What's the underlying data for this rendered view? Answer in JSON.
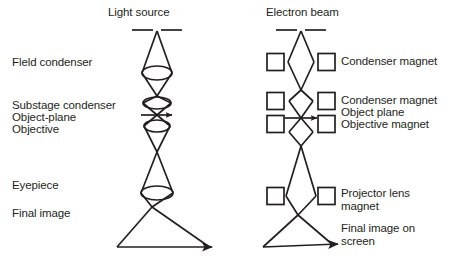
{
  "figure": {
    "type": "diagram",
    "kind": "ray-path-comparison",
    "background_color": "#ffffff",
    "ink_color": "#231f20",
    "panels": [
      {
        "id": "optical-microscope",
        "side": "left",
        "axis_x": 157,
        "source": {
          "name": "light-source",
          "label": "Light source",
          "label_x": 108,
          "label_y": 8,
          "aperture_y": 30,
          "aperture_gap_px": 8,
          "aperture_half_width": 25
        },
        "lens_style": "biconvex-ellipse",
        "elements": [
          {
            "name": "field-condenser",
            "label": "Field condenser",
            "label_x": 12,
            "label_y": 57,
            "lens_y": 73,
            "lens_rx": 15,
            "lens_ry": 7
          },
          {
            "name": "substage-condenser",
            "label": "Substage condenser",
            "label_x": 12,
            "label_y": 100,
            "lens_y": 103,
            "lens_rx": 14,
            "lens_ry": 6
          },
          {
            "name": "object-plane",
            "label": "Object-plane",
            "label_x": 12,
            "label_y": 112,
            "plane_y": 115,
            "arrow": "right"
          },
          {
            "name": "objective",
            "label": "Objective",
            "label_x": 12,
            "label_y": 124,
            "lens_y": 126,
            "lens_rx": 13,
            "lens_ry": 6
          },
          {
            "name": "eyepiece",
            "label": "Eyepiece",
            "label_x": 12,
            "label_y": 180,
            "lens_y": 193,
            "lens_rx": 16,
            "lens_ry": 7
          },
          {
            "name": "final-image",
            "label": "Final image",
            "label_x": 12,
            "label_y": 208,
            "image_y": 247,
            "arrow": "right"
          }
        ],
        "crossovers_y": [
          96,
          152,
          207
        ]
      },
      {
        "id": "electron-microscope",
        "side": "right",
        "axis_x": 301,
        "source": {
          "name": "electron-beam",
          "label": "Electron beam",
          "label_x": 266,
          "label_y": 8,
          "aperture_y": 30,
          "aperture_gap_px": 8,
          "aperture_half_width": 25
        },
        "lens_style": "square-magnet-pair",
        "magnet_box_size": 17,
        "magnet_box_offset_x": 34,
        "elements": [
          {
            "name": "condenser-magnet-1",
            "label": "Condenser magnet",
            "label_x": 340,
            "label_y": 62,
            "box_y": 62
          },
          {
            "name": "condenser-magnet-2",
            "label": "Condenser magnet",
            "label_x": 340,
            "label_y": 101,
            "box_y": 101
          },
          {
            "name": "object-plane",
            "label": "Object plane",
            "label_x": 340,
            "label_y": 113,
            "plane_y": 118,
            "arrow": "right"
          },
          {
            "name": "objective-magnet",
            "label": "Objective magnet",
            "label_x": 340,
            "label_y": 125,
            "box_y": 124
          },
          {
            "name": "projector-lens-magnet",
            "label": "Projector lens\nmagnet",
            "label_x": 340,
            "label_y": 192,
            "box_y": 196
          },
          {
            "name": "final-image-on-screen",
            "label": "Final image on\nscreen",
            "label_x": 340,
            "label_y": 224,
            "image_y": 247,
            "arrow": "right"
          }
        ],
        "crossovers_y": [
          90,
          146,
          215
        ]
      }
    ]
  },
  "labels": {
    "left": {
      "light_source": "Light source",
      "field_condenser": "Fleld condenser",
      "substage_condenser": "Substage condenser",
      "object_plane": "Object-plane",
      "objective": "Objective",
      "eyepiece": "Eyepiece",
      "final_image": "Final image"
    },
    "right": {
      "electron_beam": "Electron beam",
      "condenser_magnet_1": "Condenser magnet",
      "condenser_magnet_2": "Condenser magnet",
      "object_plane": "Object plane",
      "objective_magnet": "Objective magnet",
      "projector_lens_magnet_line1": "Projector lens",
      "projector_lens_magnet_line2": "magnet",
      "final_image_line1": "Final image on",
      "final_image_line2": "screen"
    }
  }
}
